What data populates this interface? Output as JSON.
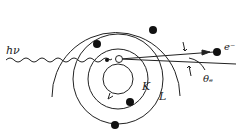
{
  "diagram": {
    "title": "",
    "labels": {
      "photon": "hν",
      "electron": "e⁻",
      "angle": "θₑ",
      "inner_shell": "K",
      "outer_shell": "L"
    },
    "colors": {
      "stroke": "#222222",
      "background": "#ffffff",
      "electron_fill": "#111111",
      "vacancy_fill": "#ffffff"
    },
    "nucleus_center": [
      118,
      58
    ],
    "shells": [
      {
        "name": "nucleus-ring",
        "r": 12
      },
      {
        "name": "K",
        "r": 26
      },
      {
        "name": "L",
        "r": 44
      },
      {
        "name": "outer-arc",
        "r": 63
      }
    ],
    "electrons": [
      {
        "shell": "L",
        "x": 98,
        "y": 42
      },
      {
        "shell": "L",
        "x": 154,
        "y": 28
      },
      {
        "shell": "K",
        "x": 128,
        "y": 101
      },
      {
        "shell": "L",
        "x": 114,
        "y": 125
      }
    ],
    "vacancy": {
      "x": 119,
      "y": 59
    },
    "photon_path": {
      "from": [
        6,
        60
      ],
      "to": [
        112,
        59
      ]
    },
    "electron_path": {
      "from": [
        119,
        59
      ],
      "to": [
        216,
        52
      ]
    },
    "reference_line": {
      "from": [
        119,
        59
      ],
      "to": [
        238,
        64
      ]
    }
  }
}
